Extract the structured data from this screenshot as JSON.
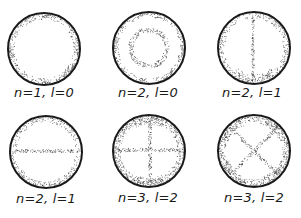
{
  "figure": {
    "title": "",
    "panels": [
      {
        "label": "n=1, l=0",
        "pattern": "uniform",
        "cx": 44,
        "cy": 49,
        "r": 36,
        "label_x": 44,
        "label_y": 85
      },
      {
        "label": "n=2, l=0",
        "pattern": "ring-node",
        "cx": 149,
        "cy": 48,
        "r": 36,
        "label_x": 148,
        "label_y": 85
      },
      {
        "label": "n=2, l=1",
        "pattern": "vertical-node",
        "cx": 254,
        "cy": 48,
        "r": 36,
        "label_x": 252,
        "label_y": 85
      },
      {
        "label": "n=2, l=1",
        "pattern": "horizontal-node",
        "cx": 46,
        "cy": 152,
        "r": 36,
        "label_x": 46,
        "label_y": 191
      },
      {
        "label": "n=3, l=2",
        "pattern": "cross-node",
        "cx": 149,
        "cy": 151,
        "r": 36,
        "label_x": 148,
        "label_y": 190
      },
      {
        "label": "n=3, l=2",
        "pattern": "diagonal-cross-node",
        "cx": 254,
        "cy": 151,
        "r": 36,
        "label_x": 254,
        "label_y": 190
      }
    ],
    "colors": {
      "outline": "#1a1a1a",
      "dots": "#3a3a3a",
      "background": "#ffffff"
    }
  }
}
